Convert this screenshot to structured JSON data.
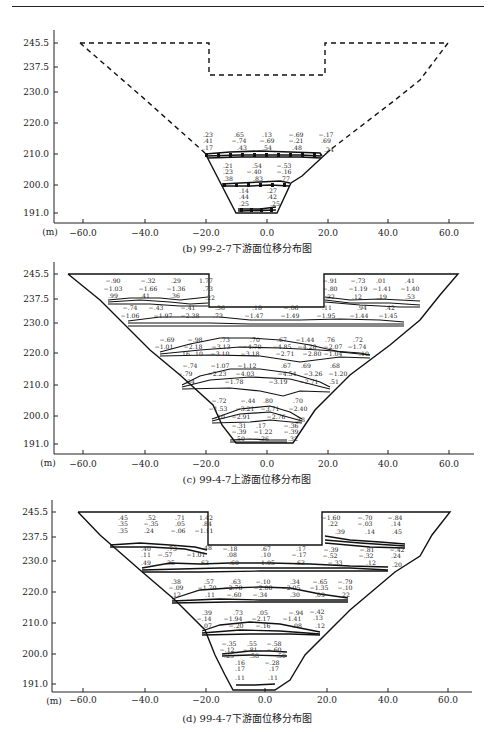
{
  "figure": {
    "panels": [
      {
        "id": "b",
        "caption": "(b) 99-2-7下游面位移分布图",
        "y_ticks": [
          "245.5",
          "237.5",
          "230.0",
          "220.0",
          "210.0",
          "200.0",
          "191.0"
        ],
        "x_ticks": [
          "−60.0",
          "−40.0",
          "−20.0",
          "0.0",
          "20.0",
          "40.0",
          "60.0"
        ],
        "unit_label": "(m)",
        "outline_style": "dashed-upper / solid-lower",
        "labels": {
          "row_210_top1": [
            ".23",
            ".65",
            ".13",
            "−.69",
            "−.17"
          ],
          "row_210_top2": [
            ".41",
            "−.74",
            "−.69",
            "−.21",
            ".69"
          ],
          "row_210_top3": [
            ".17",
            ".43",
            ".54",
            ".48",
            ".24"
          ],
          "row_200_top1": [
            ".21",
            ".54",
            "−.53"
          ],
          "row_200_top2": [
            ".23",
            "−.40",
            "−.16"
          ],
          "row_200_top3": [
            ".38",
            ".83",
            ".77"
          ],
          "row_200_bot1": [
            ".14",
            ".27"
          ],
          "row_200_bot2": [
            ".44",
            ".42"
          ],
          "row_191": [
            ".25",
            ".25"
          ]
        }
      },
      {
        "id": "c",
        "caption": "(c) 99-4-7上游面位移分布图",
        "y_ticks": [
          "245.5",
          "237.5",
          "230.0",
          "220.0",
          "210.0",
          "200.0",
          "191.0"
        ],
        "x_ticks": [
          "−60.0",
          "−40.0",
          "−20.0",
          "0.0",
          "20.0",
          "40.0",
          "60.0"
        ],
        "unit_label": "(m)",
        "labels": {
          "left_237_r1": [
            "−.90",
            "−.32",
            ".29",
            "1.77"
          ],
          "left_237_r2": [
            "−1.03",
            "−1.66",
            "−1.36",
            ".73"
          ],
          "left_237_r3": [
            ".99",
            ".41",
            ".36",
            ".22"
          ],
          "right_237_r1": [
            "−.91",
            "−.73",
            ".01",
            ".41"
          ],
          "right_237_r2": [
            "−.80",
            "−1.19",
            "−1.41",
            "−1.40"
          ],
          "right_237_r3": [
            ".32",
            ".12",
            ".19",
            ".53"
          ],
          "row_234": [
            "−.74",
            "−.43",
            "−.41",
            ".36",
            ".18",
            "−.06",
            ".11",
            ".94",
            ".42"
          ],
          "row_230_r1": [
            "−1.06",
            "−1.97",
            "−2.38",
            ".73",
            "−1.47",
            "−1.49",
            "−1.95",
            "−1.44",
            "−1.45"
          ],
          "row_220_r1": [
            "−.69",
            "−.98",
            ".73",
            ".70",
            ".67",
            "−1.44",
            ".76",
            ".72"
          ],
          "row_220_r2": [
            "−1.01",
            "−2.18",
            "−3.13",
            "−4.70",
            "−4.85",
            "−4.28",
            "−2.07",
            "−1.74"
          ],
          "row_220_r3": [
            ".16",
            ".10",
            "−3.10",
            "−3.18",
            "−2.71",
            "−2.80",
            "−1.04",
            ".10"
          ],
          "row_210_r1": [
            "−.74",
            "−1.07",
            "−1.12",
            ".67",
            ".69",
            ".68"
          ],
          "row_210_r2": [
            "−.79",
            "−2.23",
            "−4.03",
            "−4.54",
            "−3.26",
            "−1.20"
          ],
          "row_210_r3": [
            ".34",
            "−1.78",
            "−3.19",
            "−2.71",
            ".51"
          ],
          "row_200_r1": [
            "−.72",
            "−.44",
            ".80",
            ".70"
          ],
          "row_200_r2": [
            "−1.53",
            "−3.21",
            "−3.71",
            "−2.40"
          ],
          "row_200_r3": [
            ".10",
            "−2.91",
            "−2.76",
            ".38"
          ],
          "row_196": [
            "−.31",
            ".17",
            "−.36"
          ],
          "row_194": [
            "−.39",
            "−1.22",
            "−.39"
          ],
          "row_191": [
            ".50",
            ".36",
            ".32"
          ]
        }
      },
      {
        "id": "d",
        "caption": "(d) 99-4-7下游面位移分布图",
        "y_ticks": [
          "245.5",
          "237.5",
          "230.0",
          "220.0",
          "210.0",
          "200.0",
          "191.0"
        ],
        "x_ticks": [
          "−60.0",
          "−40.0",
          "−20.0",
          "0.0",
          "20.0",
          "40.0",
          "60.0"
        ],
        "unit_label": "(m)",
        "labels": {
          "left_237_r1": [
            ".45",
            ".52",
            ".71",
            "1.42"
          ],
          "left_237_r2": [
            ".35",
            "−.35",
            ".05",
            ".84"
          ],
          "left_237_r3": [
            ".35",
            ".24",
            "−.06",
            "−1.11"
          ],
          "right_237_r1": [
            "−1.60",
            "−.70",
            "−.84"
          ],
          "right_237_r2": [
            ".22",
            "−.03",
            ".14"
          ],
          "right_237_r3": [
            ".39",
            ".14",
            ".45"
          ],
          "row_234_r1": [
            ".40",
            ".73",
            ".48",
            "−.18",
            ".67",
            ".17",
            "−.39",
            "−.81",
            "−.42"
          ],
          "row_234_r2": [
            ".11",
            "−.57",
            "−1.01",
            ".08",
            ".10",
            "−.17",
            "−.52",
            "−.32",
            ".24"
          ],
          "row_230": [
            ".49",
            ".35",
            ".63",
            ".60",
            "1.05",
            ".63",
            "−.33",
            ".12",
            ".20"
          ],
          "row_220_r1": [
            ".38",
            ".57",
            ".63",
            "−.10",
            ".34",
            "−.65",
            "−.79"
          ],
          "row_220_r2": [
            "−.09",
            "−1.70",
            "−2.78",
            "−2.08",
            "−2.05",
            "−1.35",
            "−.10"
          ],
          "row_220_r3": [
            ".12",
            ".11",
            "−.60",
            "−.34",
            ".30",
            ".09",
            ".22"
          ],
          "row_210_r1": [
            ".39",
            ".73",
            ".05",
            "−.94",
            "−.42"
          ],
          "row_210_r2": [
            "−.14",
            "−1.94",
            "−2.17",
            "−1.41",
            ".13"
          ],
          "row_210_r3": [
            ".07",
            "−.20",
            "−.16",
            ".08",
            ".12"
          ],
          "row_200_r1": [
            "−.35",
            ".55",
            "−.58"
          ],
          "row_200_r2": [
            "−.12",
            "−.81",
            "−.60"
          ],
          "row_200_r3": [
            ".25",
            ".58",
            ".50"
          ],
          "row_196": [
            ".16",
            "−.28"
          ],
          "row_194": [
            ".17",
            ".17"
          ],
          "row_191": [
            ".11",
            ".11"
          ]
        }
      }
    ]
  }
}
